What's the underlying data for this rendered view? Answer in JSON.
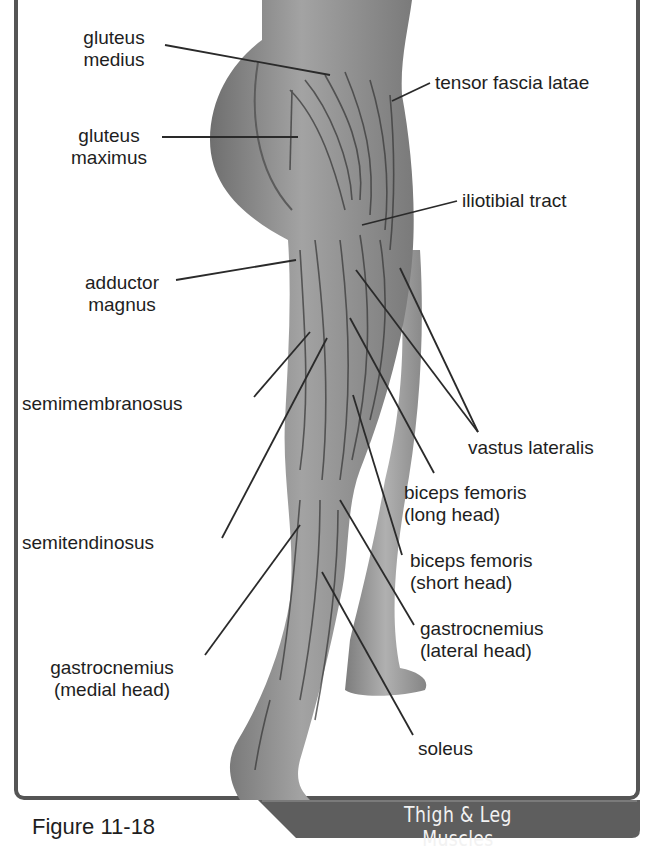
{
  "figure": {
    "caption": "Figure 11-18",
    "banner_title": "Thigh & Leg Muscles",
    "colors": {
      "frame": "#555555",
      "banner": "#5e5e5e",
      "skin_light": "#9a9a9a",
      "skin_dark": "#6f6f6f",
      "fiber": "#3a3a3a",
      "leader": "#2a2a2a",
      "text": "#1e1e1e"
    }
  },
  "labels": [
    {
      "id": "gluteus-medius",
      "text": "gluteus\nmedius",
      "x": 76,
      "y": 27,
      "align": "center",
      "w": 76,
      "lines": [
        [
          165,
          45,
          330,
          75
        ]
      ]
    },
    {
      "id": "gluteus-maximus",
      "text": "gluteus\nmaximus",
      "x": 70,
      "y": 125,
      "align": "center",
      "w": 78,
      "lines": [
        [
          162,
          137,
          298,
          137
        ]
      ]
    },
    {
      "id": "tensor-fascia-latae",
      "text": "tensor fascia latae",
      "x": 435,
      "y": 72,
      "align": "left",
      "w": 200,
      "lines": [
        [
          430,
          83,
          392,
          101
        ]
      ]
    },
    {
      "id": "iliotibial-tract",
      "text": "iliotibial tract",
      "x": 462,
      "y": 190,
      "align": "left",
      "w": 160,
      "lines": [
        [
          457,
          201,
          362,
          225
        ]
      ]
    },
    {
      "id": "adductor-magnus",
      "text": "adductor\nmagnus",
      "x": 75,
      "y": 272,
      "align": "center",
      "w": 94,
      "lines": [
        [
          176,
          280,
          296,
          260
        ]
      ]
    },
    {
      "id": "semimembranosus",
      "text": "semimembranosus",
      "x": 22,
      "y": 393,
      "align": "left",
      "w": 230,
      "lines": [
        [
          254,
          397,
          310,
          332
        ]
      ]
    },
    {
      "id": "vastus-lateralis",
      "text": "vastus lateralis",
      "x": 468,
      "y": 437,
      "align": "left",
      "w": 160,
      "lines": [
        [
          478,
          432,
          356,
          270
        ],
        [
          478,
          432,
          400,
          268
        ]
      ]
    },
    {
      "id": "biceps-femoris-long",
      "text": "biceps femoris\n(long head)",
      "x": 404,
      "y": 482,
      "align": "left",
      "w": 160,
      "lines": [
        [
          434,
          473,
          350,
          318
        ]
      ]
    },
    {
      "id": "semitendinosus",
      "text": "semitendinosus",
      "x": 22,
      "y": 532,
      "align": "left",
      "w": 200,
      "lines": [
        [
          222,
          538,
          327,
          338
        ]
      ]
    },
    {
      "id": "biceps-femoris-short",
      "text": "biceps femoris\n(short head)",
      "x": 410,
      "y": 550,
      "align": "left",
      "w": 160,
      "lines": [
        [
          402,
          555,
          353,
          395
        ]
      ]
    },
    {
      "id": "gastrocnemius-lateral",
      "text": "gastrocnemius\n(lateral head)",
      "x": 420,
      "y": 618,
      "align": "left",
      "w": 160,
      "lines": [
        [
          414,
          625,
          340,
          500
        ]
      ]
    },
    {
      "id": "gastrocnemius-medial",
      "text": "gastrocnemius\n(medial head)",
      "x": 22,
      "y": 657,
      "align": "center",
      "w": 180,
      "lines": [
        [
          205,
          655,
          300,
          525
        ]
      ]
    },
    {
      "id": "soleus",
      "text": "soleus",
      "x": 418,
      "y": 738,
      "align": "left",
      "w": 80,
      "lines": [
        [
          413,
          735,
          322,
          572
        ]
      ]
    }
  ]
}
